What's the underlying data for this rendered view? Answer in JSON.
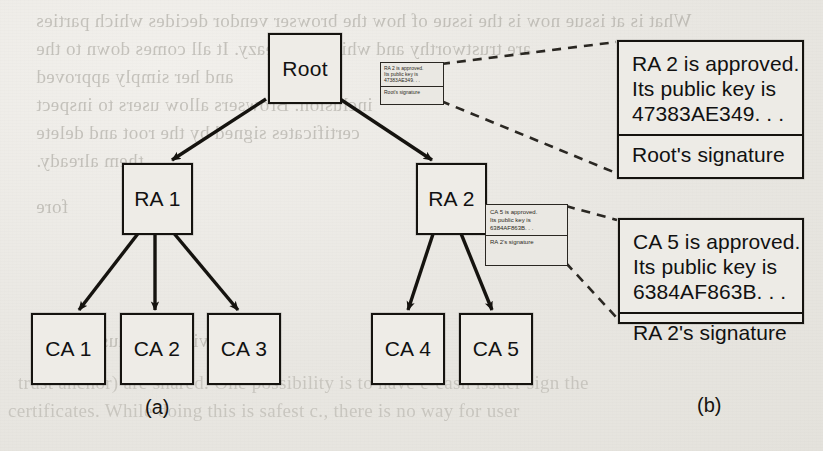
{
  "figure": {
    "caption_a": "(a)",
    "caption_b": "(b)"
  },
  "tree": {
    "nodes": [
      {
        "id": "root",
        "label": "Root"
      },
      {
        "id": "ra1",
        "label": "RA 1"
      },
      {
        "id": "ra2",
        "label": "RA 2"
      },
      {
        "id": "ca1",
        "label": "CA 1"
      },
      {
        "id": "ca2",
        "label": "CA 2"
      },
      {
        "id": "ca3",
        "label": "CA 3"
      },
      {
        "id": "ca4",
        "label": "CA 4"
      },
      {
        "id": "ca5",
        "label": "CA 5"
      }
    ],
    "edges": [
      {
        "from": "root",
        "to": "ra1"
      },
      {
        "from": "root",
        "to": "ra2"
      },
      {
        "from": "ra1",
        "to": "ca1"
      },
      {
        "from": "ra1",
        "to": "ca2"
      },
      {
        "from": "ra1",
        "to": "ca3"
      },
      {
        "from": "ra2",
        "to": "ca4"
      },
      {
        "from": "ra2",
        "to": "ca5"
      }
    ]
  },
  "certificates": [
    {
      "id": "root-signed-ra2",
      "line1": "RA 2 is approved.",
      "line2": "Its public key is",
      "line3": "47383AE349. . .",
      "signature": "Root's signature"
    },
    {
      "id": "ra2-signed-ca5",
      "line1": "CA 5 is approved.",
      "line2": "Its public key is",
      "line3": "6384AF863B. . .",
      "signature": "RA 2's signature"
    }
  ],
  "showthrough": {
    "lines": [
      "What is at issue now is the issue of how the browser vendor decides  which parties",
      "are trustworthy and which are sleazy. It all comes down to the",
      "and her simply approved",
      "inclusion. Browsers allow users to inspect",
      "certificates signed by the root and delete",
      "them already.",
      "fore",
      "viable because PKI is",
      "trust anchor) are shared. One possibility is to have e-cash issuer sign the",
      "certificates. While doing this is safest c., there is no way for user"
    ]
  },
  "colors": {
    "ink": "#15130f",
    "paper": "#ebe9e4",
    "ghost": "#9a978f"
  }
}
